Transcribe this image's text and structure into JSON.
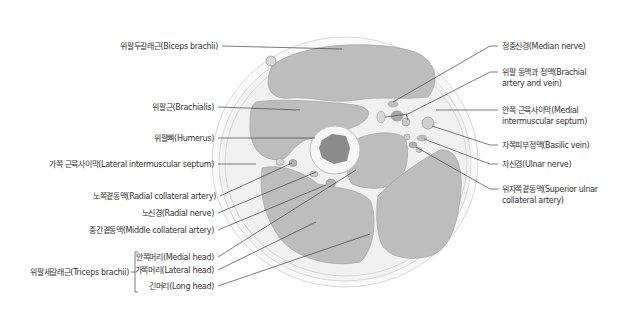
{
  "diagram": {
    "colors": {
      "muscle": "#bdbdbd",
      "fascia": "#f2f2f2",
      "skin_outline": "#d4d4d4",
      "bone_cortex": "#f4f4f4",
      "marrow": "#8a8a8a",
      "leader_line": "#444444",
      "text": "#333333"
    },
    "left_labels": [
      {
        "id": "biceps",
        "text": "위팔두갈래근(Biceps brachii)"
      },
      {
        "id": "brachialis",
        "text": "위팔근(Brachialis)"
      },
      {
        "id": "humerus",
        "text": "위팔뼈(Humerus)"
      },
      {
        "id": "lat_septum",
        "text": "가쪽 근육사이막(Lateral intermuscular septum)"
      },
      {
        "id": "radial_coll_artery",
        "text": "노쪽곁동맥(Radial collateral artery)"
      },
      {
        "id": "radial_nerve",
        "text": "노신경(Radial nerve)"
      },
      {
        "id": "middle_coll_artery",
        "text": "중간곁동맥(Middle collateral artery)"
      }
    ],
    "triceps": {
      "group_label": "위팔세갈래근(Triceps brachii)",
      "heads": [
        {
          "id": "medial_head",
          "text": "안쪽머리(Medial head)"
        },
        {
          "id": "lateral_head",
          "text": "가쪽머리(Lateral head)"
        },
        {
          "id": "long_head",
          "text": "긴머리(Long head)"
        }
      ]
    },
    "right_labels": [
      {
        "id": "median_nerve",
        "line1": "정중신경(Median nerve)",
        "line2": ""
      },
      {
        "id": "brachial_av",
        "line1": "위팔 동맥과 정맥(Brachial",
        "line2": "artery and vein)"
      },
      {
        "id": "med_septum",
        "line1": "안쪽 근육사이막(Medial",
        "line2": "intermuscular septum)"
      },
      {
        "id": "basilic_vein",
        "line1": "자쪽피부정맥(Basilic vein)",
        "line2": ""
      },
      {
        "id": "ulnar_nerve",
        "line1": "자신경(Ulnar nerve)",
        "line2": ""
      },
      {
        "id": "sup_ulnar_artery",
        "line1": "위자쪽곁동맥(Superior ulnar",
        "line2": "collateral artery)"
      }
    ]
  }
}
